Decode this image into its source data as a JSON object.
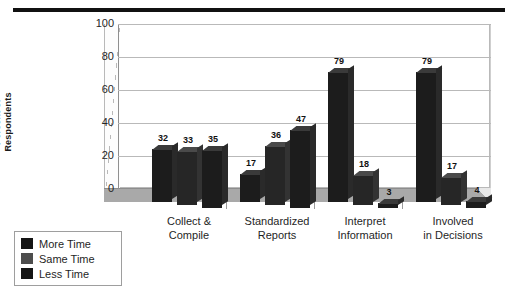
{
  "decorations": {
    "top_rule": "horizontal-rule"
  },
  "chart_data": {
    "type": "bar",
    "title": "",
    "xlabel": "",
    "ylabel": "Percent of Respondents",
    "ylabel_lines": [
      "Percent of",
      "Respondents"
    ],
    "ylim": [
      0,
      100
    ],
    "yticks": [
      100,
      80,
      60,
      40,
      20,
      0
    ],
    "grid": true,
    "three_d": true,
    "legend_position": "bottom-left",
    "categories": [
      "Collect & Compile",
      "Standardized Reports",
      "Interpret Information",
      "Involved in Decisions"
    ],
    "category_lines": [
      [
        "Collect &",
        "Compile"
      ],
      [
        "Standardized",
        "Reports"
      ],
      [
        "Interpret",
        "Information"
      ],
      [
        "Involved",
        "in Decisions"
      ]
    ],
    "series": [
      {
        "name": "More Time",
        "color": "#141414",
        "values": [
          32,
          17,
          79,
          79
        ]
      },
      {
        "name": "Same Time",
        "color": "#4d4d4d",
        "values": [
          33,
          36,
          18,
          17
        ]
      },
      {
        "name": "Less Time",
        "color": "#141414",
        "values": [
          35,
          47,
          3,
          4
        ]
      }
    ]
  },
  "legend": {
    "items": [
      {
        "label": "More Time",
        "swatch": "black"
      },
      {
        "label": "Same Time",
        "swatch": "gray"
      },
      {
        "label": "Less Time",
        "swatch": "black"
      }
    ]
  }
}
